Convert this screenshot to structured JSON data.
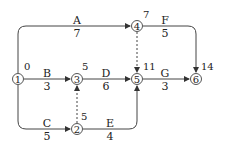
{
  "nodes": [
    {
      "id": "1",
      "label": "1",
      "time": "0"
    },
    {
      "id": "2",
      "label": "2",
      "time": "5"
    },
    {
      "id": "3",
      "label": "3",
      "time": "5"
    },
    {
      "id": "4",
      "label": "4",
      "time": "7"
    },
    {
      "id": "5",
      "label": "5",
      "time": "11"
    },
    {
      "id": "6",
      "label": "6",
      "time": "14"
    }
  ],
  "activities": [
    {
      "name": "A",
      "duration": "7",
      "from": "1",
      "to": "4"
    },
    {
      "name": "B",
      "duration": "3",
      "from": "1",
      "to": "3"
    },
    {
      "name": "C",
      "duration": "5",
      "from": "1",
      "to": "2"
    },
    {
      "name": "D",
      "duration": "6",
      "from": "3",
      "to": "5"
    },
    {
      "name": "E",
      "duration": "4",
      "from": "2",
      "to": "5"
    },
    {
      "name": "F",
      "duration": "5",
      "from": "4",
      "to": "6"
    },
    {
      "name": "G",
      "duration": "3",
      "from": "5",
      "to": "6"
    }
  ],
  "dummies": [
    {
      "from": "2",
      "to": "3"
    },
    {
      "from": "4",
      "to": "5"
    }
  ],
  "colors": {
    "line": "#444444",
    "text": "#222222"
  }
}
